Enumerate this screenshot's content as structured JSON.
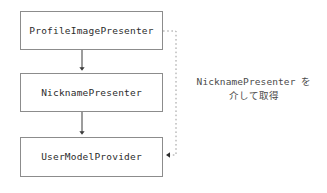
{
  "diagram": {
    "background_color": "#ffffff",
    "border_color": "#8c8c8c",
    "text_color": "#2b2b2b",
    "connector_color": "#4a4a4a",
    "dotted_connector_color": "#9a9a9a",
    "nodes": [
      {
        "id": "profile-image-presenter",
        "label": "ProfileImagePresenter"
      },
      {
        "id": "nickname-presenter",
        "label": "NicknamePresenter"
      },
      {
        "id": "user-model-provider",
        "label": "UserModelProvider"
      }
    ],
    "connectors": [
      {
        "id": "profile-to-nickname",
        "style": "solid",
        "arrow": "filled-triangle",
        "direction": "down"
      },
      {
        "id": "nickname-to-usermodel",
        "style": "solid",
        "arrow": "filled-triangle",
        "direction": "down"
      },
      {
        "id": "profile-to-usermodel-indirect",
        "style": "dotted",
        "arrow": "filled-triangle",
        "direction": "left"
      }
    ],
    "annotation": {
      "id": "via-nickname-presenter",
      "line1": "NicknamePresenter を",
      "line2": "介して取得"
    }
  }
}
